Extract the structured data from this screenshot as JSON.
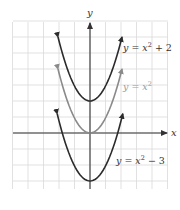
{
  "chart_data": {
    "type": "line",
    "title": "",
    "xlabel": "x",
    "ylabel": "y",
    "xlim": [
      -5,
      5
    ],
    "ylim": [
      -3.4,
      7
    ],
    "grid": true,
    "legend_position": "inline labels on right",
    "series": [
      {
        "name": "y = x² + 2",
        "label": "y = x² + 2",
        "formula": "x^2 + 2",
        "shift": 2,
        "color": "#2b2b2b",
        "x_range": [
          -2,
          2
        ],
        "vertex": [
          0,
          2
        ],
        "x": [
          -2,
          -1,
          0,
          1,
          2
        ],
        "values": [
          6,
          3,
          2,
          3,
          6
        ]
      },
      {
        "name": "y = x²",
        "label": "y = x²",
        "formula": "x^2",
        "shift": 0,
        "color": "#8a8a8a",
        "x_range": [
          -2,
          2
        ],
        "vertex": [
          0,
          0
        ],
        "x": [
          -2,
          -1,
          0,
          1,
          2
        ],
        "values": [
          4,
          1,
          0,
          1,
          4
        ]
      },
      {
        "name": "y = x² − 3",
        "label": "y = x² − 3",
        "formula": "x^2 - 3",
        "shift": -3,
        "color": "#2b2b2b",
        "x_range": [
          -2.05,
          2.05
        ],
        "vertex": [
          0,
          -3
        ],
        "x": [
          -2,
          -1,
          0,
          1,
          2
        ],
        "values": [
          1,
          -2,
          -3,
          -2,
          1
        ]
      }
    ],
    "annotations": [
      "y = x² + 2",
      "y = x²",
      "y = x² − 3"
    ]
  },
  "axes": {
    "x_label": "x",
    "y_label": "y"
  },
  "labels": {
    "top": {
      "pre": "y = x",
      "sup": "2",
      "post": " + 2"
    },
    "middle": {
      "pre": "y = x",
      "sup": "2",
      "post": ""
    },
    "bottom": {
      "pre": "y = x",
      "sup": "2",
      "post": " − 3"
    }
  },
  "colors": {
    "grid": "#d9d9d9",
    "axis": "#333333",
    "curve_dark": "#2b2b2b",
    "curve_light": "#8a8a8a"
  }
}
